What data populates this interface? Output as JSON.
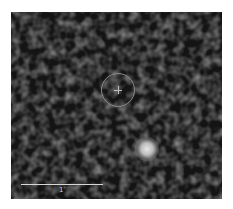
{
  "image": {
    "description": "Grayscale astronomical field with a circled target position and a bright source",
    "background_color": "#141414",
    "target_marker": {
      "shape": "circle-with-crosshair",
      "color": "#8a8a8a",
      "cx": 107,
      "cy": 78,
      "r": 17
    },
    "bright_source": {
      "cx": 136,
      "cy": 137,
      "r": 9,
      "color": "#e0e0e0"
    },
    "scale_bar": {
      "label": "1′",
      "x1": 11,
      "x2": 93,
      "y": 172
    }
  }
}
